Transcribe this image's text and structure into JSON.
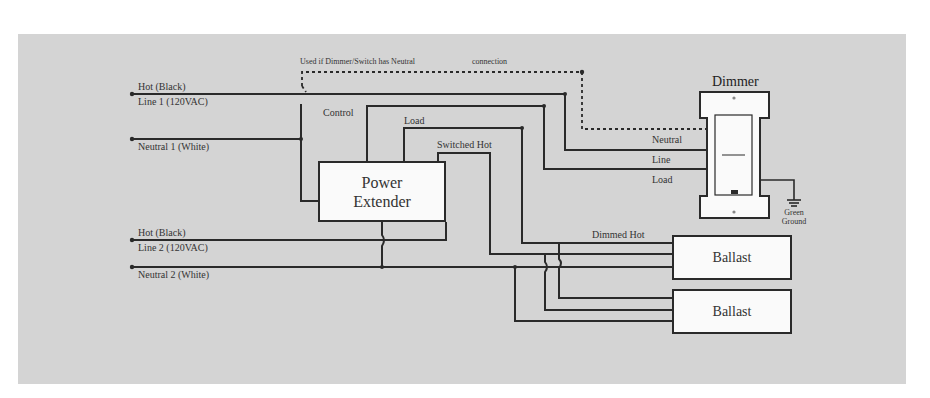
{
  "diagram": {
    "title": "Dimmer",
    "note": {
      "part1": "Used if Dimmer/Switch has Neutral",
      "part2": "connection"
    },
    "inputs": {
      "hot1": "Hot (Black)",
      "line1": "Line 1 (120VAC)",
      "neutral1": "Neutral 1 (White)",
      "hot2": "Hot (Black)",
      "line2": "Line 2 (120VAC)",
      "neutral2": "Neutral 2 (White)"
    },
    "wire_labels": {
      "control": "Control",
      "load": "Load",
      "switched_hot": "Switched Hot",
      "dimmed_hot": "Dimmed Hot"
    },
    "dimmer_terminals": {
      "neutral": "Neutral",
      "line": "Line",
      "load": "Load"
    },
    "ground": {
      "line1": "Green",
      "line2": "Ground"
    },
    "power_extender": {
      "line1": "Power",
      "line2": "Extender"
    },
    "ballasts": [
      {
        "label": "Ballast"
      },
      {
        "label": "Ballast"
      }
    ],
    "colors": {
      "background": "#d4d4d4",
      "wire": "#2a2a2a",
      "box_fill": "#fafafa"
    }
  }
}
